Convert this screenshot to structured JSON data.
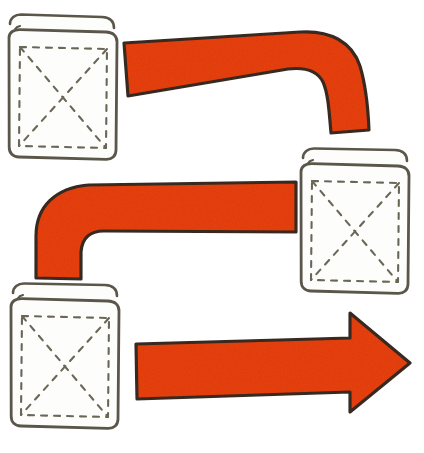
{
  "image": {
    "title": "Hand-drawn diagram: three books connected by red arrows",
    "background_color": "#ffffff",
    "width": 424,
    "height": 453
  },
  "palette": {
    "arrow_fill": "#e8400f",
    "arrow_fill_dark": "#d4350c",
    "arrow_outline": "#3a2a20",
    "book_outline": "#5a564a",
    "book_stitch": "#6b6658",
    "book_fill": "#fdfdfb",
    "background": "#ffffff"
  },
  "objects": {
    "books": [
      {
        "id": "book-top-left",
        "label": "book-top-left",
        "position": "top-left",
        "x": 5,
        "y": 15,
        "width": 110,
        "height": 145,
        "decoration": "dashed-x-pattern"
      },
      {
        "id": "book-middle-right",
        "label": "book-middle-right",
        "position": "middle-right",
        "x": 298,
        "y": 148,
        "width": 108,
        "height": 145,
        "decoration": "dashed-x-pattern"
      },
      {
        "id": "book-bottom-left",
        "label": "book-bottom-left",
        "position": "bottom-left",
        "x": 8,
        "y": 283,
        "width": 108,
        "height": 145,
        "decoration": "dashed-x-pattern"
      }
    ],
    "arrows": [
      {
        "id": "arrow-top",
        "label": "arrow-top",
        "shape": "elbow-band",
        "direction": "left-to-right-then-down",
        "has_head": false,
        "from": "book-top-left",
        "to": "book-middle-right",
        "fill": "#e8400f"
      },
      {
        "id": "arrow-middle",
        "label": "arrow-middle",
        "shape": "elbow-band",
        "direction": "up-then-left-to-right",
        "has_head": false,
        "from": "book-bottom-left",
        "to": "book-middle-right",
        "fill": "#e8400f"
      },
      {
        "id": "arrow-bottom",
        "label": "arrow-bottom",
        "shape": "straight-arrow",
        "direction": "left-to-right",
        "has_head": true,
        "from": "book-bottom-left",
        "to": "right",
        "fill": "#e8400f"
      }
    ]
  }
}
